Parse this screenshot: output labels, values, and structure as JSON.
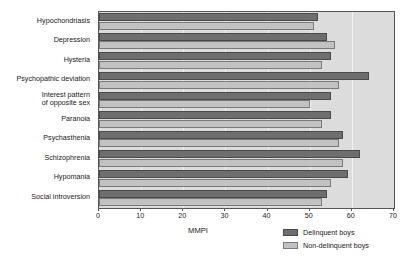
{
  "chart_data": {
    "type": "bar",
    "orientation": "horizontal",
    "title": "",
    "xlabel": "MMPI",
    "ylabel": "",
    "xlim": [
      0,
      70
    ],
    "xticks": [
      0,
      10,
      20,
      30,
      40,
      50,
      60,
      70
    ],
    "xticklabels": [
      "0",
      "10",
      "20",
      "30",
      "40",
      "50",
      "60",
      "70"
    ],
    "grid": true,
    "grid_axis": "x",
    "legend_position": "bottom-right",
    "categories": [
      "Hypochondriasis",
      "Depression",
      "Hysteria",
      "Psychopathic deviation",
      "Interest pattern\nof opposite sex",
      "Paranoia",
      "Psychasthenia",
      "Schizophrenia",
      "Hypomania",
      "Social introversion"
    ],
    "series": [
      {
        "name": "Delinquent boys",
        "color": "#6e6e6e",
        "values": [
          52,
          54,
          55,
          64,
          55,
          55,
          58,
          62,
          59,
          54
        ]
      },
      {
        "name": "Non-delinquent boys",
        "color": "#c2c2c2",
        "values": [
          51,
          56,
          53,
          57,
          50,
          53,
          57,
          58,
          55,
          53
        ]
      }
    ]
  },
  "axis": {
    "x_title": "MMPI"
  },
  "legend": {
    "entries": [
      {
        "label": "Delinquent boys",
        "swatch": "dark"
      },
      {
        "label": "Non-delinquent boys",
        "swatch": "light"
      }
    ]
  },
  "colors": {
    "plot_background": "#dcdcdc",
    "gridline": "#f2f2f2",
    "frame": "#555555",
    "delinquent": "#6e6e6e",
    "non_delinquent": "#c2c2c2",
    "text": "#1a1a1a"
  }
}
